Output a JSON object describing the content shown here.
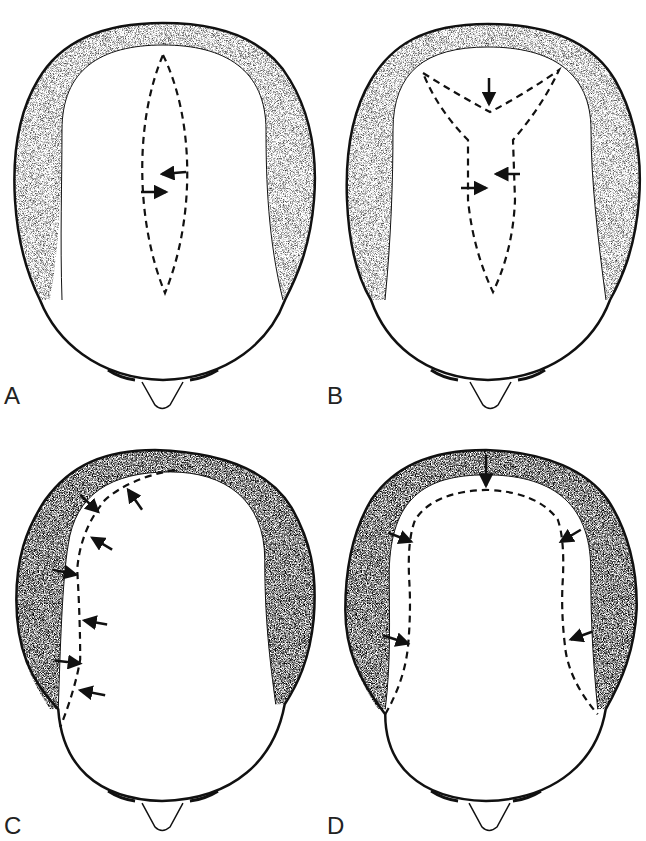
{
  "figure": {
    "panels": [
      {
        "label": "A",
        "pattern": "fusiform-midline-ellipse",
        "arrows": 2
      },
      {
        "label": "B",
        "pattern": "Y-shaped-midline",
        "arrows": 3
      },
      {
        "label": "C",
        "pattern": "unilateral-curved-margin",
        "arrows": 7
      },
      {
        "label": "D",
        "pattern": "U-shaped-horseshoe",
        "arrows": 5
      }
    ],
    "colors": {
      "outline": "#111111",
      "stipple": "#555555",
      "background": "#ffffff"
    }
  }
}
